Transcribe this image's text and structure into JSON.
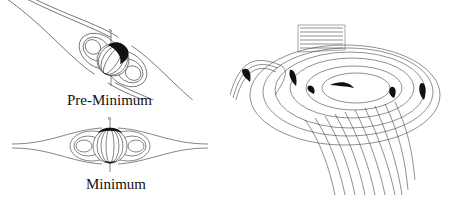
{
  "diagrams": [
    {
      "id": "pre-minimum",
      "caption": "Pre-Minimum",
      "pole_label": "N",
      "tilt_deg": 35
    },
    {
      "id": "minimum",
      "caption": "Minimum",
      "pole_label": "N",
      "tilt_deg": 0
    }
  ],
  "surface_plot": {
    "description": "3D wire-mesh heliospheric current sheet (ballerina skirt)"
  },
  "colors": {
    "line": "#222222",
    "fill": "#111111",
    "background": "#ffffff"
  }
}
